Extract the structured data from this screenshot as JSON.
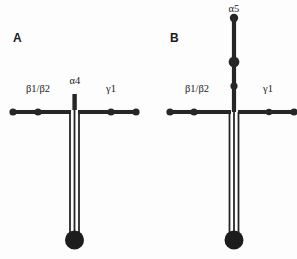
{
  "figure": {
    "background_color": "#fdfdfd",
    "line_color": "#262626",
    "text_color": "#1b1b1b",
    "width": 297,
    "height": 259
  },
  "panels": [
    {
      "id": "A",
      "letter": "A",
      "letter_pos": {
        "x": 13,
        "y": 42
      },
      "center_x": 74,
      "labels": [
        {
          "name": "beta-chain",
          "text": "β1/β2",
          "x": 38,
          "y": 92,
          "anchor": "middle"
        },
        {
          "name": "alpha-chain",
          "text": "α4",
          "x": 75,
          "y": 84,
          "anchor": "middle"
        },
        {
          "name": "gamma-chain",
          "text": "γ1",
          "x": 111,
          "y": 92,
          "anchor": "middle"
        }
      ],
      "cross_y": 112,
      "left_arm": {
        "x1": 12,
        "x2": 71
      },
      "right_arm": {
        "x1": 78,
        "x2": 137
      },
      "left_nodes": [
        {
          "cx": 13,
          "cy": 112,
          "r": 3.6
        },
        {
          "cx": 38,
          "cy": 112,
          "r": 3.6
        }
      ],
      "right_nodes": [
        {
          "cx": 111,
          "cy": 112,
          "r": 3.6
        },
        {
          "cx": 136,
          "cy": 112,
          "r": 3.6
        }
      ],
      "alpha_stub": {
        "x": 72.4,
        "y": 94,
        "w": 4.4,
        "h": 16
      },
      "descenders": [
        {
          "x": 70,
          "y1": 112,
          "y2": 233
        },
        {
          "x": 74.5,
          "y1": 110,
          "y2": 233
        },
        {
          "x": 79,
          "y1": 112,
          "y2": 233
        }
      ],
      "foot": {
        "cx": 74.5,
        "cy": 240,
        "r": 9.5
      }
    },
    {
      "id": "B",
      "letter": "B",
      "letter_pos": {
        "x": 170,
        "y": 42
      },
      "center_x": 234,
      "labels": [
        {
          "name": "alpha-chain",
          "text": "α5",
          "x": 234,
          "y": 12,
          "anchor": "middle"
        },
        {
          "name": "beta-chain",
          "text": "β1/β2",
          "x": 197,
          "y": 92,
          "anchor": "middle"
        },
        {
          "name": "gamma-chain",
          "text": "γ1",
          "x": 268,
          "y": 92,
          "anchor": "middle"
        }
      ],
      "cross_y": 112,
      "left_arm": {
        "x1": 169,
        "x2": 231
      },
      "right_arm": {
        "x1": 238,
        "x2": 296
      },
      "left_nodes": [
        {
          "cx": 170,
          "cy": 112,
          "r": 3.6
        },
        {
          "cx": 194,
          "cy": 112,
          "r": 3.6
        }
      ],
      "right_nodes": [
        {
          "cx": 269,
          "cy": 112,
          "r": 3.2
        },
        {
          "cx": 294,
          "cy": 112,
          "r": 3.6
        }
      ],
      "alpha_arm": {
        "x": 234,
        "y1": 18,
        "y2": 112
      },
      "alpha_nodes": [
        {
          "name": "alpha-tip-node",
          "cx": 234,
          "cy": 18,
          "r": 4.2
        },
        {
          "name": "alpha-mid-node",
          "cx": 234,
          "cy": 62,
          "r": 5.4
        },
        {
          "name": "alpha-lower-node",
          "cx": 234,
          "cy": 86,
          "r": 3.6
        }
      ],
      "descenders": [
        {
          "x": 229.5,
          "y1": 112,
          "y2": 233
        },
        {
          "x": 234,
          "y1": 112,
          "y2": 233
        },
        {
          "x": 238.5,
          "y1": 112,
          "y2": 233
        }
      ],
      "foot": {
        "cx": 234,
        "cy": 240,
        "r": 9.5
      }
    }
  ]
}
